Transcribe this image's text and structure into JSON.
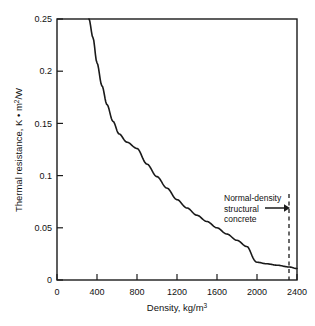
{
  "chart_data": {
    "type": "line",
    "title": "",
    "xlabel": "Density, kg/m3",
    "xlabel_main": "Density, kg/m",
    "xlabel_sup": "3",
    "ylabel": "Thermal resistance, K • m2/W",
    "ylabel_part1": "Thermal resistance, K • m",
    "ylabel_sup": "2",
    "ylabel_part2": "/W",
    "xlim": [
      0,
      2400
    ],
    "ylim": [
      0,
      0.25
    ],
    "grid": false,
    "legend": "none",
    "x_ticks": [
      0,
      400,
      800,
      1200,
      1600,
      2000,
      2400
    ],
    "x_tick_labels": [
      "0",
      "400",
      "800",
      "1200",
      "1600",
      "2000",
      "2400"
    ],
    "y_ticks": [
      0,
      0.05,
      0.1,
      0.15,
      0.2,
      0.25
    ],
    "y_tick_labels": [
      "0",
      "0.05",
      "0.1",
      "0.15",
      "0.2",
      "0.25"
    ],
    "series": [
      {
        "name": "Thermal resistance vs density",
        "x": [
          320,
          360,
          400,
          450,
          500,
          560,
          620,
          700,
          800,
          900,
          1000,
          1100,
          1200,
          1300,
          1400,
          1500,
          1600,
          1700,
          1800,
          1900,
          2000,
          2100,
          2200,
          2320,
          2400
        ],
        "values": [
          0.25,
          0.232,
          0.208,
          0.186,
          0.168,
          0.152,
          0.14,
          0.132,
          0.126,
          0.111,
          0.099,
          0.088,
          0.077,
          0.069,
          0.062,
          0.056,
          0.05,
          0.044,
          0.038,
          0.032,
          0.017,
          0.0155,
          0.0142,
          0.0125,
          0.011
        ]
      }
    ],
    "annotations": [
      {
        "name": "normal-density-structural-concrete",
        "lines": [
          "Normal-density",
          "structural",
          "concrete"
        ],
        "marker_type": "dashed-vertical-line-with-arrow",
        "x_value": 2320
      }
    ]
  },
  "colors": {
    "axis": "#1a1a1a",
    "curve": "#1a1a1a",
    "text": "#111111",
    "background": "#ffffff"
  }
}
